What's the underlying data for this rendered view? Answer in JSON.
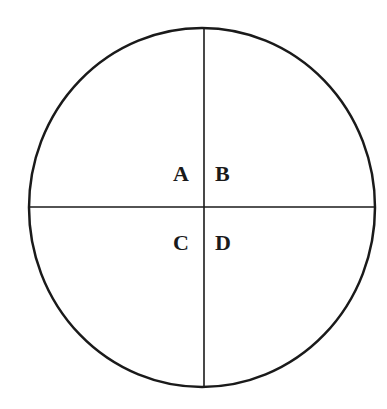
{
  "diagram": {
    "type": "circle-quadrants",
    "stroke_color": "#1a1a1a",
    "quadrants": [
      {
        "id": "top-left",
        "label": "A"
      },
      {
        "id": "top-right",
        "label": "B"
      },
      {
        "id": "bottom-left",
        "label": "C"
      },
      {
        "id": "bottom-right",
        "label": "D"
      }
    ]
  }
}
